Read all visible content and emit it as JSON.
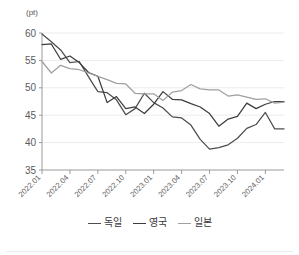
{
  "chart_data": {
    "type": "line",
    "title": "",
    "subtitle": "",
    "xlabel": "",
    "ylabel": "",
    "unit_label": "(pt)",
    "ylim": [
      35,
      60
    ],
    "yticks": [
      35,
      40,
      45,
      50,
      55,
      60
    ],
    "grid": true,
    "grid_axis": "y",
    "legend_position": "bottom",
    "x": [
      "2022.01",
      "2022.02",
      "2022.03",
      "2022.04",
      "2022.05",
      "2022.06",
      "2022.07",
      "2022.08",
      "2022.09",
      "2022.10",
      "2022.11",
      "2022.12",
      "2023.01",
      "2023.02",
      "2023.03",
      "2023.04",
      "2023.05",
      "2023.06",
      "2023.07",
      "2023.08",
      "2023.09",
      "2023.10",
      "2023.11",
      "2023.12",
      "2024.01",
      "2024.02",
      "2024.03"
    ],
    "xtick_labels": [
      "2022.01",
      "2022.04",
      "2022.07",
      "2022.10",
      "2023.01",
      "2023.04",
      "2023.07",
      "2023.10",
      "2024.01"
    ],
    "xtick_indices": [
      0,
      3,
      6,
      9,
      12,
      15,
      18,
      21,
      24
    ],
    "series": [
      {
        "name": "독일",
        "color": "#4d4d4f",
        "values": [
          59.8,
          58.4,
          56.9,
          54.6,
          54.8,
          52.0,
          49.3,
          49.1,
          47.8,
          45.1,
          46.2,
          49.0,
          47.3,
          46.3,
          44.7,
          44.5,
          43.2,
          40.6,
          38.8,
          39.1,
          39.6,
          40.8,
          42.6,
          43.3,
          45.5,
          42.5,
          42.5
        ]
      },
      {
        "name": "영국",
        "color": "#3d3d3f",
        "values": [
          57.9,
          58.0,
          55.2,
          55.8,
          54.6,
          52.8,
          52.1,
          47.3,
          48.4,
          46.2,
          46.5,
          45.3,
          47.0,
          49.3,
          47.9,
          47.8,
          47.1,
          46.5,
          45.3,
          43.0,
          44.3,
          44.8,
          47.2,
          46.2,
          47.0,
          47.5,
          47.5
        ]
      },
      {
        "name": "일본",
        "color": "#a0a0a2",
        "values": [
          54.8,
          52.7,
          54.1,
          53.5,
          53.3,
          52.7,
          52.1,
          51.5,
          50.8,
          50.7,
          49.0,
          48.9,
          48.9,
          47.7,
          49.2,
          49.5,
          50.6,
          49.8,
          49.6,
          49.6,
          48.5,
          48.7,
          48.3,
          47.9,
          48.0,
          47.2,
          47.4
        ]
      }
    ]
  },
  "legend": {
    "items": [
      {
        "label": "독일",
        "color": "#4d4d4f"
      },
      {
        "label": "영국",
        "color": "#3d3d3f"
      },
      {
        "label": "일본",
        "color": "#a0a0a2"
      }
    ]
  },
  "axes": {
    "unit": "(pt)"
  }
}
